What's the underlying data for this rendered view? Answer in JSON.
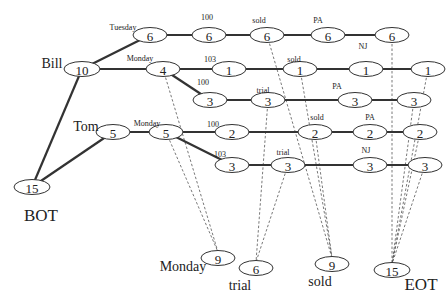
{
  "diagram": {
    "nodes": [
      {
        "id": "bot",
        "value": "15",
        "x": 32,
        "y": 187
      },
      {
        "id": "bill",
        "value": "10",
        "x": 82,
        "y": 69
      },
      {
        "id": "tue6",
        "value": "6",
        "x": 150,
        "y": 35
      },
      {
        "id": "t6a",
        "value": "6",
        "x": 209,
        "y": 35
      },
      {
        "id": "t6b",
        "value": "6",
        "x": 267,
        "y": 35
      },
      {
        "id": "t6c",
        "value": "6",
        "x": 328,
        "y": 35
      },
      {
        "id": "t6d",
        "value": "6",
        "x": 392,
        "y": 35
      },
      {
        "id": "bmon4",
        "value": "4",
        "x": 163,
        "y": 69
      },
      {
        "id": "b1a",
        "value": "1",
        "x": 229,
        "y": 69
      },
      {
        "id": "b1b",
        "value": "1",
        "x": 300,
        "y": 69
      },
      {
        "id": "b1c",
        "value": "1",
        "x": 366,
        "y": 69
      },
      {
        "id": "b1d",
        "value": "1",
        "x": 428,
        "y": 69
      },
      {
        "id": "b3a",
        "value": "3",
        "x": 210,
        "y": 100
      },
      {
        "id": "b3b",
        "value": "3",
        "x": 268,
        "y": 100
      },
      {
        "id": "b3c",
        "value": "3",
        "x": 355,
        "y": 100
      },
      {
        "id": "b3d",
        "value": "3",
        "x": 414,
        "y": 100
      },
      {
        "id": "tom",
        "value": "5",
        "x": 113,
        "y": 132
      },
      {
        "id": "tmon5",
        "value": "5",
        "x": 166,
        "y": 132
      },
      {
        "id": "t2a",
        "value": "2",
        "x": 232,
        "y": 132
      },
      {
        "id": "t2b",
        "value": "2",
        "x": 315,
        "y": 132
      },
      {
        "id": "t2c",
        "value": "2",
        "x": 370,
        "y": 132
      },
      {
        "id": "t2d",
        "value": "2",
        "x": 420,
        "y": 132
      },
      {
        "id": "t3a",
        "value": "3",
        "x": 232,
        "y": 165
      },
      {
        "id": "t3b",
        "value": "3",
        "x": 288,
        "y": 165
      },
      {
        "id": "t3c",
        "value": "3",
        "x": 370,
        "y": 165
      },
      {
        "id": "t3d",
        "value": "3",
        "x": 425,
        "y": 165
      },
      {
        "id": "monday9",
        "value": "9",
        "x": 218,
        "y": 258
      },
      {
        "id": "trial6",
        "value": "6",
        "x": 256,
        "y": 268
      },
      {
        "id": "sold9",
        "value": "9",
        "x": 332,
        "y": 264
      },
      {
        "id": "eot15",
        "value": "15",
        "x": 392,
        "y": 270
      }
    ],
    "edges": [
      [
        "bot",
        "bill"
      ],
      [
        "bot",
        "tom"
      ],
      [
        "bill",
        "tue6"
      ],
      [
        "tue6",
        "t6a"
      ],
      [
        "t6a",
        "t6b"
      ],
      [
        "t6b",
        "t6c"
      ],
      [
        "t6c",
        "t6d"
      ],
      [
        "bill",
        "bmon4"
      ],
      [
        "bmon4",
        "b1a"
      ],
      [
        "b1a",
        "b1b"
      ],
      [
        "b1b",
        "b1c"
      ],
      [
        "b1c",
        "b1d"
      ],
      [
        "bmon4",
        "b3a"
      ],
      [
        "b3a",
        "b3b"
      ],
      [
        "b3b",
        "b3c"
      ],
      [
        "b3c",
        "b3d"
      ],
      [
        "tom",
        "tmon5"
      ],
      [
        "tmon5",
        "t2a"
      ],
      [
        "t2a",
        "t2b"
      ],
      [
        "t2b",
        "t2c"
      ],
      [
        "t2c",
        "t2d"
      ],
      [
        "tmon5",
        "t3a"
      ],
      [
        "t3a",
        "t3b"
      ],
      [
        "t3b",
        "t3c"
      ],
      [
        "t3c",
        "t3d"
      ]
    ],
    "dashed_edges": [
      [
        "bmon4",
        "monday9"
      ],
      [
        "tmon5",
        "monday9"
      ],
      [
        "b3b",
        "trial6"
      ],
      [
        "t3b",
        "trial6"
      ],
      [
        "t6b",
        "sold9"
      ],
      [
        "b1b",
        "sold9"
      ],
      [
        "t2b",
        "sold9"
      ],
      [
        "t2b",
        "sold9b"
      ],
      [
        "t6d",
        "eot15"
      ],
      [
        "b1d",
        "eot15"
      ],
      [
        "b3d",
        "eot15"
      ],
      [
        "t2d",
        "eot15"
      ],
      [
        "t3d",
        "eot15"
      ]
    ],
    "edge_labels": [
      {
        "text": "Tuesday",
        "x": 123,
        "y": 30,
        "size": "small"
      },
      {
        "text": "100",
        "x": 207,
        "y": 20,
        "size": "small"
      },
      {
        "text": "sold",
        "x": 259,
        "y": 23,
        "size": "small"
      },
      {
        "text": "PA",
        "x": 318,
        "y": 23,
        "size": "small"
      },
      {
        "text": "NJ",
        "x": 363,
        "y": 49,
        "size": "small"
      },
      {
        "text": "Monday",
        "x": 140,
        "y": 61,
        "size": "small"
      },
      {
        "text": "103",
        "x": 210,
        "y": 62,
        "size": "small"
      },
      {
        "text": "sold",
        "x": 294,
        "y": 62,
        "size": "small"
      },
      {
        "text": "100",
        "x": 203,
        "y": 85,
        "size": "small"
      },
      {
        "text": "trial",
        "x": 263,
        "y": 93,
        "size": "small"
      },
      {
        "text": "PA",
        "x": 337,
        "y": 89,
        "size": "small"
      },
      {
        "text": "Monday",
        "x": 147,
        "y": 126,
        "size": "small"
      },
      {
        "text": "100",
        "x": 213,
        "y": 127,
        "size": "small"
      },
      {
        "text": "sold",
        "x": 317,
        "y": 120,
        "size": "small"
      },
      {
        "text": "PA",
        "x": 370,
        "y": 120,
        "size": "small"
      },
      {
        "text": "103",
        "x": 220,
        "y": 157,
        "size": "small"
      },
      {
        "text": "trial",
        "x": 283,
        "y": 155,
        "size": "small"
      },
      {
        "text": "NJ",
        "x": 366,
        "y": 153,
        "size": "small"
      }
    ],
    "labels": [
      {
        "text": "Bill",
        "x": 52,
        "y": 68,
        "size": "big"
      },
      {
        "text": "Tom",
        "x": 86,
        "y": 131,
        "size": "big"
      },
      {
        "text": "BOT",
        "x": 41,
        "y": 221,
        "size": "huge"
      },
      {
        "text": "Monday",
        "x": 183,
        "y": 271,
        "size": "big"
      },
      {
        "text": "trial",
        "x": 240,
        "y": 290,
        "size": "big"
      },
      {
        "text": "sold",
        "x": 320,
        "y": 286,
        "size": "big"
      },
      {
        "text": "EOT",
        "x": 421,
        "y": 290,
        "size": "huge"
      }
    ]
  }
}
